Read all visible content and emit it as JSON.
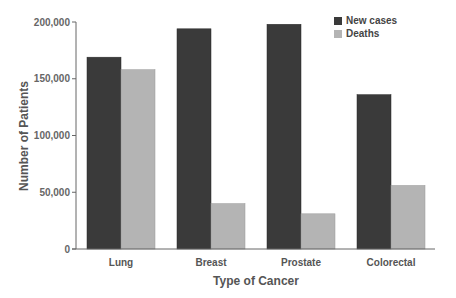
{
  "chart_data": {
    "type": "bar",
    "title": "",
    "xlabel": "Type of Cancer",
    "ylabel": "Number of Patients",
    "ylim": [
      0,
      200000
    ],
    "yticks": [
      0,
      50000,
      100000,
      150000,
      200000
    ],
    "ytick_labels": [
      "0",
      "50,000",
      "100,000",
      "150,000",
      "200,000"
    ],
    "categories": [
      "Lung",
      "Breast",
      "Prostate",
      "Colorectal"
    ],
    "series": [
      {
        "name": "New cases",
        "color": "#3a3a3a",
        "values": [
          169000,
          194000,
          198000,
          136000
        ]
      },
      {
        "name": "Deaths",
        "color": "#b4b4b4",
        "values": [
          158000,
          40000,
          31000,
          56000
        ]
      }
    ],
    "grid": false,
    "legend_position": "top-right"
  }
}
